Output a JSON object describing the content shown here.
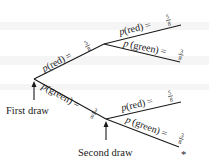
{
  "diagram": {
    "type": "probability-tree",
    "first_draw_label": "First draw",
    "second_draw_label": "Second draw",
    "asterisk": "*",
    "branches": {
      "first_red": {
        "p": "p",
        "event": "(red)",
        "eq": "=",
        "num": "5",
        "den": "8"
      },
      "first_green": {
        "p": "p",
        "event": "(green)",
        "eq": "=",
        "num": "3",
        "den": "8"
      },
      "upper_red": {
        "p": "p",
        "event": "(red)",
        "eq": "=",
        "num": "5",
        "den": "8"
      },
      "upper_green": {
        "p": "p",
        "event": "(green)",
        "eq": "=",
        "num": "3",
        "den": "8"
      },
      "lower_red": {
        "p": "p",
        "event": "(red)",
        "eq": "=",
        "num": "5",
        "den": "8"
      },
      "lower_green": {
        "p": "p",
        "event": "(green)",
        "eq": "=",
        "num": "3",
        "den": "8"
      }
    }
  }
}
